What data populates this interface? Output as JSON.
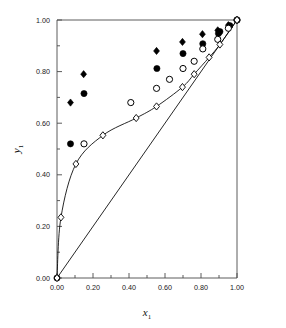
{
  "chart_data": {
    "type": "scatter",
    "title": "",
    "xlabel": "x1",
    "ylabel": "y1",
    "xlim": [
      0.0,
      1.0
    ],
    "ylim": [
      0.0,
      1.0
    ],
    "grid": false,
    "legend": "none",
    "x_ticks": [
      "0.00",
      "0.20",
      "0.40",
      "0.60",
      "0.80",
      "1.00"
    ],
    "x_tick_values": [
      0.0,
      0.2,
      0.4,
      0.6,
      0.8,
      1.0
    ],
    "x_minor_ticks": [
      0.1,
      0.3,
      0.5,
      0.7,
      0.9
    ],
    "y_ticks": [
      "0.00",
      "0.20",
      "0.40",
      "0.60",
      "0.80",
      "1.00"
    ],
    "y_tick_values": [
      0.0,
      0.2,
      0.4,
      0.6,
      0.8,
      1.0
    ],
    "y_minor_ticks": [
      0.1,
      0.3,
      0.5,
      0.7,
      0.9
    ],
    "series": [
      {
        "name": "filled-diamond",
        "marker": "filled-diamond",
        "color": "#000000",
        "line": false,
        "points": [
          [
            0.075,
            0.68
          ],
          [
            0.148,
            0.79
          ],
          [
            0.553,
            0.88
          ],
          [
            0.697,
            0.915
          ],
          [
            0.808,
            0.945
          ],
          [
            0.893,
            0.96
          ],
          [
            0.952,
            0.98
          ],
          [
            1.0,
            1.0
          ]
        ]
      },
      {
        "name": "filled-circle",
        "marker": "filled-circle",
        "color": "#000000",
        "line": false,
        "points": [
          [
            0.0,
            0.0
          ],
          [
            0.075,
            0.52
          ],
          [
            0.15,
            0.715
          ],
          [
            0.555,
            0.812
          ],
          [
            0.7,
            0.87
          ],
          [
            0.81,
            0.908
          ],
          [
            0.897,
            0.948
          ],
          [
            0.905,
            0.955
          ],
          [
            0.96,
            0.978
          ],
          [
            1.0,
            1.0
          ]
        ]
      },
      {
        "name": "open-circle",
        "marker": "open-circle",
        "color": "#000000",
        "line": false,
        "points": [
          [
            0.15,
            0.52
          ],
          [
            0.41,
            0.68
          ],
          [
            0.553,
            0.735
          ],
          [
            0.625,
            0.77
          ],
          [
            0.7,
            0.812
          ],
          [
            0.762,
            0.84
          ],
          [
            0.81,
            0.888
          ],
          [
            0.893,
            0.925
          ],
          [
            0.952,
            0.968
          ],
          [
            1.0,
            1.0
          ]
        ]
      },
      {
        "name": "open-diamond-curve",
        "marker": "open-diamond",
        "color": "#000000",
        "line": true,
        "points": [
          [
            0.0,
            0.0
          ],
          [
            0.022,
            0.235
          ],
          [
            0.105,
            0.442
          ],
          [
            0.255,
            0.553
          ],
          [
            0.44,
            0.62
          ],
          [
            0.553,
            0.665
          ],
          [
            0.697,
            0.74
          ],
          [
            0.762,
            0.79
          ],
          [
            0.845,
            0.855
          ],
          [
            0.905,
            0.905
          ],
          [
            1.0,
            1.0
          ]
        ]
      },
      {
        "name": "diagonal-reference-line",
        "marker": "none",
        "color": "#000000",
        "line": true,
        "points": [
          [
            0.0,
            0.0
          ],
          [
            1.0,
            1.0
          ]
        ]
      }
    ]
  },
  "axes": {
    "x_label_main": "x",
    "x_label_sub": "1",
    "y_label_main": "y",
    "y_label_sub": "1"
  }
}
